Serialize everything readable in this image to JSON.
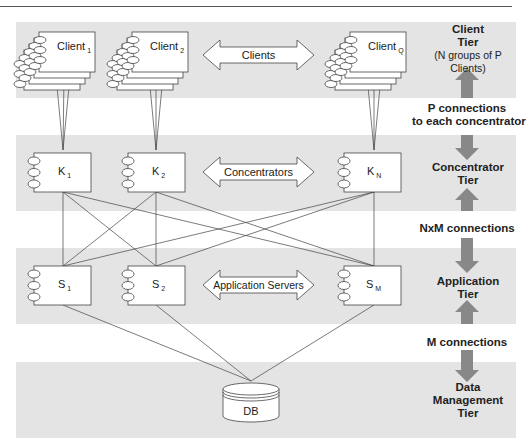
{
  "colors": {
    "band": "#e4e4e4",
    "line": "#444444",
    "tier_arrow": "#888888",
    "box_fill": "#ffffff"
  },
  "tiers": {
    "client": {
      "title_line1": "Client",
      "title_line2": "Tier",
      "subtitle_line1": "(N groups of P",
      "subtitle_line2": "Clients)",
      "nodes": [
        {
          "name": "Client",
          "sub": "1"
        },
        {
          "name": "Client",
          "sub": "2"
        },
        {
          "name": "Client",
          "sub": "Q"
        }
      ],
      "arrow_label": "Clients"
    },
    "concentrator": {
      "title_line1": "Concentrator",
      "title_line2": "Tier",
      "nodes": [
        {
          "name": "K",
          "sub": "1"
        },
        {
          "name": "K",
          "sub": "2"
        },
        {
          "name": "K",
          "sub": "N"
        }
      ],
      "arrow_label": "Concentrators"
    },
    "application": {
      "title_line1": "Application",
      "title_line2": "Tier",
      "nodes": [
        {
          "name": "S",
          "sub": "1"
        },
        {
          "name": "S",
          "sub": "2"
        },
        {
          "name": "S",
          "sub": "M"
        }
      ],
      "arrow_label": "Application Servers"
    },
    "data": {
      "title_line1": "Data",
      "title_line2": "Management",
      "title_line3": "Tier",
      "node": "DB"
    }
  },
  "connections": {
    "client_concentrator_line1": "P connections",
    "client_concentrator_line2": "to each concentrator",
    "concentrator_application": "NxM connections",
    "application_data": "M connections"
  }
}
